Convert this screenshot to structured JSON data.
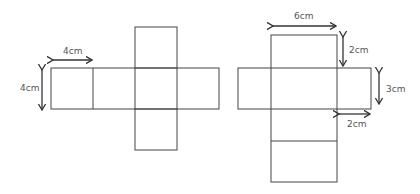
{
  "diagram": {
    "nets": [
      {
        "name": "cube-net",
        "labels": {
          "width": "4cm",
          "height": "4cm"
        }
      },
      {
        "name": "cuboid-net",
        "labels": {
          "length": "6cm",
          "depth_top": "2cm",
          "height": "3cm",
          "depth_side": "2cm"
        }
      }
    ],
    "colors": {
      "line": "#444444",
      "text": "#555555",
      "background": "#ffffff"
    }
  }
}
